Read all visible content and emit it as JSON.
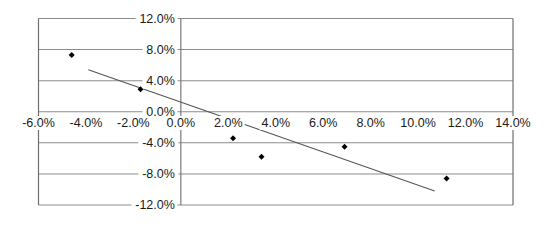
{
  "chart_data": {
    "type": "scatter",
    "title": "",
    "subtitle": "",
    "xlabel": "",
    "ylabel": "",
    "xlim": [
      -6.0,
      14.0
    ],
    "ylim": [
      -12.0,
      12.0
    ],
    "x_tick_step": 2.0,
    "y_tick_step": 4.0,
    "grid": "horizontal",
    "legend": "none",
    "x_tick_labels": [
      "-6.0%",
      "-4.0%",
      "-2.0%",
      "0.0%",
      "2.0%",
      "4.0%",
      "6.0%",
      "8.0%",
      "10.0%",
      "12.0%",
      "14.0%"
    ],
    "x_tick_values": [
      -6.0,
      -4.0,
      -2.0,
      0.0,
      2.0,
      4.0,
      6.0,
      8.0,
      10.0,
      12.0,
      14.0
    ],
    "y_tick_labels": [
      "12.0%",
      "8.0%",
      "4.0%",
      "0.0%",
      "-4.0%",
      "-8.0%",
      "-12.0%"
    ],
    "y_tick_values": [
      12.0,
      8.0,
      4.0,
      0.0,
      -4.0,
      -8.0,
      -12.0
    ],
    "series": [
      {
        "name": "observations",
        "marker": "diamond",
        "color": "#000000",
        "points": [
          {
            "x": -4.6,
            "y": 7.3
          },
          {
            "x": -1.7,
            "y": 2.9
          },
          {
            "x": 2.2,
            "y": -3.4
          },
          {
            "x": 3.4,
            "y": -5.8
          },
          {
            "x": 6.9,
            "y": -4.5
          },
          {
            "x": 11.2,
            "y": -8.6
          }
        ]
      },
      {
        "name": "trendline",
        "marker": "none",
        "color": "#555555",
        "points": [
          {
            "x": -3.9,
            "y": 5.4
          },
          {
            "x": 10.7,
            "y": -10.2
          }
        ]
      }
    ],
    "colors": {
      "marker": "#000000",
      "trendline": "#555555",
      "gridline": "#8c8c8c",
      "axis": "#6e6e6e",
      "text": "#1a1a1a",
      "background": "#ffffff"
    }
  }
}
